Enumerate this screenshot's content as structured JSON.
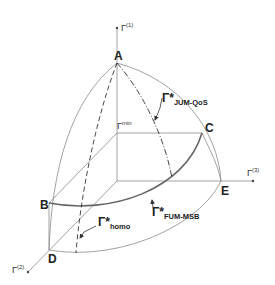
{
  "diagram": {
    "type": "3d-objective-space",
    "points": {
      "A": "A",
      "B": "B",
      "C": "C",
      "D": "D",
      "E": "E"
    },
    "axes": {
      "gamma1": {
        "base": "Γ",
        "sup": "(1)"
      },
      "gamma2": {
        "base": "Γ",
        "sup": "(2)"
      },
      "gamma3": {
        "base": "Γ",
        "sup": "(3)"
      },
      "gamma_min": {
        "base": "Γ",
        "sup": "min"
      }
    },
    "curves": {
      "jum_qos": {
        "base": "Γ*",
        "sub": "JUM-QoS",
        "style": "dash-dot"
      },
      "fum_msb": {
        "base": "Γ*",
        "sub": "FUM-MSB",
        "style": "solid-thick"
      },
      "homo": {
        "base": "Γ*",
        "sub": "homo",
        "style": "dashed"
      }
    },
    "colors": {
      "lines": "#8a8a8a",
      "thick_curve": "#666666",
      "text": "#222222"
    }
  }
}
